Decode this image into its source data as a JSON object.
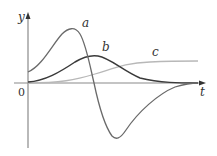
{
  "figure": {
    "axes": {
      "x_label": "t",
      "y_label": "y",
      "origin_label": "0"
    },
    "curves": [
      {
        "name": "a",
        "label": "a",
        "color": "#6a6a6a",
        "description": "oscillating curve: starts above 0, rises to a tall peak, crosses axis, deep minimum, returns to 0"
      },
      {
        "name": "b",
        "label": "b",
        "color": "#3a3a3a",
        "description": "single hump starting at 0, peaking, decaying back to 0"
      },
      {
        "name": "c",
        "label": "c",
        "color": "#b8b8b8",
        "description": "sigmoid rising from 0 to a horizontal plateau"
      }
    ],
    "colors": {
      "axis": "#8a8a8a",
      "background": "#ffffff"
    }
  }
}
